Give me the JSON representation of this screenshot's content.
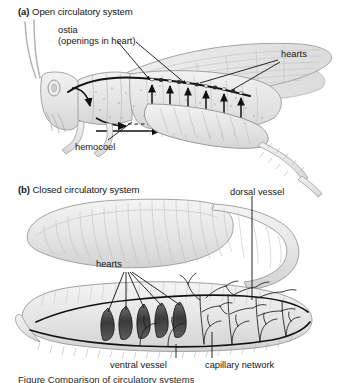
{
  "figure": {
    "type": "biology-diagram",
    "background_color": "#ffffff",
    "ink_color": "#161616",
    "organism_fill": "#e8e8e8",
    "organism_line": "#9a9a9a",
    "heart_fill": "#4a4a4a"
  },
  "panels": [
    {
      "id": "a",
      "marker": "(a)",
      "title": "Open circulatory system",
      "organism": "grasshopper",
      "labels": [
        {
          "name": "ostia",
          "line1": "ostia",
          "line2": "(openings in heart)"
        },
        {
          "name": "hearts",
          "line1": "hearts"
        },
        {
          "name": "hemocoel",
          "line1": "hemocoel"
        }
      ]
    },
    {
      "id": "b",
      "marker": "(b)",
      "title": "Closed circulatory system",
      "organism": "earthworm",
      "labels": [
        {
          "name": "dorsal-vessel",
          "line1": "dorsal vessel"
        },
        {
          "name": "hearts",
          "line1": "hearts"
        },
        {
          "name": "ventral-vessel",
          "line1": "ventral vessel"
        },
        {
          "name": "capillary-network",
          "line1": "capillary network"
        }
      ]
    }
  ],
  "text": {
    "panel_a_marker": "(a)",
    "panel_a_title": "Open circulatory system",
    "panel_b_marker": "(b)",
    "panel_b_title": "Closed circulatory system",
    "ostia_line1": "ostia",
    "ostia_line2": "(openings in heart)",
    "hearts_a": "hearts",
    "hemocoel": "hemocoel",
    "dorsal_vessel": "dorsal vessel",
    "hearts_b": "hearts",
    "ventral_vessel": "ventral vessel",
    "capillary_network": "capillary network",
    "caption_cut": "Figure    Comparison of circulatory systems"
  }
}
